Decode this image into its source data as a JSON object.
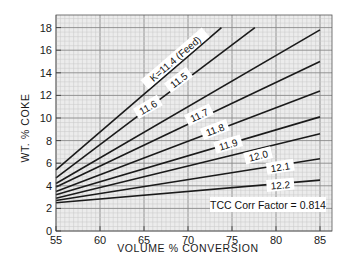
{
  "chart_data": {
    "type": "line",
    "title": "",
    "xlabel": "VOLUME % CONVERSION",
    "ylabel": "WT. % COKE",
    "xlim": [
      55,
      85
    ],
    "ylim": [
      0,
      19
    ],
    "x_ticks": [
      55,
      60,
      65,
      70,
      75,
      80,
      85
    ],
    "y_ticks": [
      0,
      2,
      4,
      6,
      8,
      10,
      12,
      14,
      16,
      18
    ],
    "grid": true,
    "legend": "inline labels along lines",
    "annotation": "TCC Corr Factor = 0.814",
    "series": [
      {
        "name": "K=11.4 (Feed)",
        "label": "K=11.4 (Feed)",
        "x": [
          55,
          73.8
        ],
        "y": [
          5.4,
          18.0
        ]
      },
      {
        "name": "11.5",
        "label": "11.5",
        "x": [
          55,
          77.6
        ],
        "y": [
          4.7,
          18.0
        ]
      },
      {
        "name": "11.6",
        "label": "11.6",
        "x": [
          55,
          85
        ],
        "y": [
          4.2,
          17.8
        ]
      },
      {
        "name": "11.7",
        "label": "11.7",
        "x": [
          55,
          85
        ],
        "y": [
          3.9,
          15.0
        ]
      },
      {
        "name": "11.8",
        "label": "11.8",
        "x": [
          55,
          85
        ],
        "y": [
          3.5,
          12.4
        ]
      },
      {
        "name": "11.9",
        "label": "11.9",
        "x": [
          55,
          85
        ],
        "y": [
          3.2,
          10.1
        ]
      },
      {
        "name": "12.0",
        "label": "12.0",
        "x": [
          55,
          85
        ],
        "y": [
          2.9,
          8.6
        ]
      },
      {
        "name": "12.1",
        "label": "12.1",
        "x": [
          55,
          85
        ],
        "y": [
          2.7,
          6.4
        ]
      },
      {
        "name": "12.2",
        "label": "12.2",
        "x": [
          55,
          85
        ],
        "y": [
          2.5,
          4.5
        ]
      }
    ],
    "label_positions": [
      {
        "x": 68.6,
        "y": 15.2
      },
      {
        "x": 69.0,
        "y": 13.3
      },
      {
        "x": 65.5,
        "y": 10.9
      },
      {
        "x": 71.3,
        "y": 10.2
      },
      {
        "x": 73.1,
        "y": 8.9
      },
      {
        "x": 74.6,
        "y": 7.6
      },
      {
        "x": 78.0,
        "y": 6.6
      },
      {
        "x": 80.5,
        "y": 5.6
      },
      {
        "x": 80.5,
        "y": 4.0
      }
    ]
  },
  "colors": {
    "line": "#1a1a1a",
    "grid_minor": "#c9c9c9",
    "grid_major": "#8a8a8a",
    "plot_bg": "#ececec"
  }
}
